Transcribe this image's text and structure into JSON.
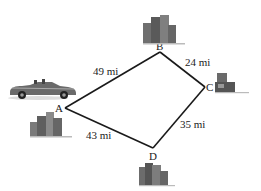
{
  "diagram": {
    "vertices": [
      {
        "id": "A",
        "label": "A"
      },
      {
        "id": "B",
        "label": "B"
      },
      {
        "id": "C",
        "label": "C"
      },
      {
        "id": "D",
        "label": "D"
      }
    ],
    "edges": [
      {
        "from": "A",
        "to": "B",
        "label": "49 mi"
      },
      {
        "from": "B",
        "to": "C",
        "label": "24 mi"
      },
      {
        "from": "C",
        "to": "D",
        "label": "35 mi"
      },
      {
        "from": "D",
        "to": "A",
        "label": "43 mi"
      }
    ],
    "icons": {
      "car": "convertible-car-icon",
      "city": "city-buildings-icon"
    },
    "colors": {
      "line": "#1a1a1a",
      "building": "#6b6b6b",
      "car": "#5a5a5a"
    }
  }
}
